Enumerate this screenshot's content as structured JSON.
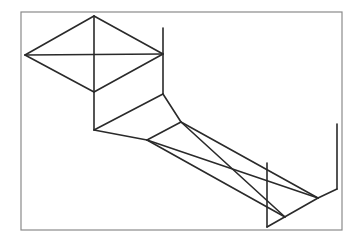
{
  "diagram": {
    "frame": {
      "x": 21,
      "y": 12,
      "width": 321,
      "height": 218,
      "stroke": "#8a8a8a"
    },
    "stroke_color": "#2a2a2a",
    "stroke_width": 1.6,
    "points": {
      "A": [
        25,
        55
      ],
      "B": [
        94,
        16
      ],
      "C": [
        163,
        54
      ],
      "D": [
        94,
        92
      ],
      "E": [
        163,
        28
      ],
      "F": [
        163,
        94
      ],
      "G": [
        94,
        130
      ],
      "H": [
        181,
        122
      ],
      "I": [
        147,
        140
      ],
      "J": [
        318,
        198
      ],
      "K": [
        337,
        189
      ],
      "L": [
        337,
        124
      ],
      "M": [
        267,
        163
      ],
      "N": [
        267,
        227
      ],
      "O": [
        285,
        217
      ]
    },
    "segments": [
      [
        "A",
        "B"
      ],
      [
        "B",
        "C"
      ],
      [
        "C",
        "D"
      ],
      [
        "D",
        "A"
      ],
      [
        "A",
        "C"
      ],
      [
        "B",
        "G"
      ],
      [
        "E",
        "F"
      ],
      [
        "F",
        "G"
      ],
      [
        "F",
        "H"
      ],
      [
        "H",
        "I"
      ],
      [
        "G",
        "I"
      ],
      [
        "I",
        "J"
      ],
      [
        "I",
        "O"
      ],
      [
        "H",
        "O"
      ],
      [
        "H",
        "J"
      ],
      [
        "J",
        "K"
      ],
      [
        "K",
        "L"
      ],
      [
        "M",
        "N"
      ],
      [
        "N",
        "J"
      ]
    ]
  }
}
